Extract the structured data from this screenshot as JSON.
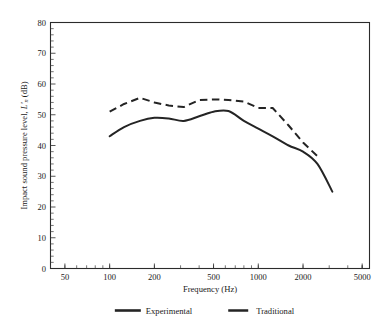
{
  "chart_data": {
    "type": "line",
    "title": "",
    "xlabel": "Frequency (Hz)",
    "ylabel": "Impact sound pressure level, L'n (dB)",
    "ylabel_parts": {
      "main": "Impact sound pressure level, ",
      "italic": "L'",
      "sub": "n",
      "unit": " (dB)"
    },
    "xscale": "log",
    "xlim": [
      40,
      5600
    ],
    "ylim": [
      0,
      80
    ],
    "xticks": [
      50,
      100,
      200,
      500,
      1000,
      2000,
      5000
    ],
    "xticklabels": [
      "50",
      "100",
      "200",
      "500",
      "1000",
      "2000",
      "5000"
    ],
    "yticks": [
      0,
      10,
      20,
      30,
      40,
      50,
      60,
      70,
      80
    ],
    "yticklabels": [
      "0",
      "10",
      "20",
      "30",
      "40",
      "50",
      "60",
      "70",
      "80"
    ],
    "grid": false,
    "legend_position": "below",
    "x": [
      100,
      125,
      160,
      200,
      250,
      315,
      400,
      500,
      630,
      800,
      1000,
      1250,
      1600,
      2000,
      2500,
      3150
    ],
    "series": [
      {
        "name": "Experimental",
        "style": "solid",
        "color": "#242424",
        "values": [
          43.0,
          46.0,
          48.0,
          49.0,
          48.8,
          48.0,
          49.5,
          51.0,
          51.2,
          48.0,
          45.5,
          43.0,
          40.0,
          38.0,
          34.0,
          25.0
        ]
      },
      {
        "name": "Traditional",
        "style": "dashed",
        "color": "#242424",
        "values": [
          51.0,
          53.5,
          55.5,
          54.0,
          53.0,
          52.5,
          54.8,
          55.0,
          54.8,
          54.3,
          52.2,
          52.2,
          46.5,
          41.0,
          36.5,
          null
        ]
      }
    ],
    "legend": [
      {
        "label": "Experimental",
        "style": "solid"
      },
      {
        "label": "Traditional",
        "style": "dashed"
      }
    ]
  }
}
